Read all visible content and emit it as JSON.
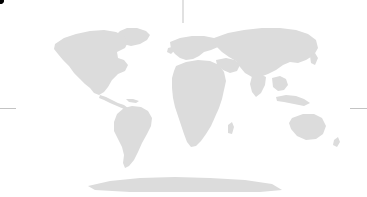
{
  "figure": {
    "kind": "world-map",
    "projection": "robinson",
    "background_color": "#ffffff",
    "width": 367,
    "height": 197
  },
  "map": {
    "land_color": "#dcdcdc",
    "graticule_color": "#9a9a9a",
    "frame_color": "#8f8f8f",
    "bounds": {
      "left": 14,
      "right": 352,
      "top": 21,
      "bottom": 192,
      "center_x": 183,
      "center_y": 108
    },
    "graticule": {
      "meridians_deg": [
        -180,
        -150,
        -120,
        -90,
        -60,
        -30,
        0,
        30,
        60,
        90,
        120,
        150,
        180
      ],
      "parallels_deg": [
        75,
        50,
        25,
        0,
        -25,
        -50,
        -75
      ],
      "meridian_interval_deg": 30,
      "parallel_interval_deg": 25,
      "equator_deg": 0,
      "central_meridian_deg": 0,
      "equator_extends_beyond_frame": true,
      "central_meridian_extends_beyond_frame": true
    }
  },
  "route": {
    "type": "great-circle-flight-path",
    "line_style": "dashed",
    "line_color": "#1a1a1a",
    "endpoint_color": "#000000",
    "endpoint_radius_px": 4,
    "endpoints": [
      {
        "name": "origin-marker",
        "x": 79,
        "y": 59
      },
      {
        "name": "destination-marker",
        "x": 119,
        "y": 62
      }
    ],
    "path_points": [
      {
        "x": 79,
        "y": 59
      },
      {
        "x": 86,
        "y": 56.6
      },
      {
        "x": 93,
        "y": 55.4
      },
      {
        "x": 100,
        "y": 55.6
      },
      {
        "x": 107,
        "y": 57.2
      },
      {
        "x": 113,
        "y": 59.4
      },
      {
        "x": 119,
        "y": 62
      }
    ]
  },
  "landmasses": [
    {
      "name": "north-america"
    },
    {
      "name": "south-america"
    },
    {
      "name": "greenland"
    },
    {
      "name": "europe"
    },
    {
      "name": "africa"
    },
    {
      "name": "asia"
    },
    {
      "name": "australia"
    },
    {
      "name": "antarctica"
    }
  ]
}
